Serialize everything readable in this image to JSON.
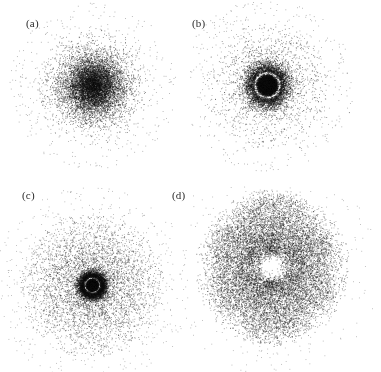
{
  "figure": {
    "width": 381,
    "height": 372,
    "background": "#ffffff",
    "point_color": "#101010",
    "type": "multi-panel-scatter-density"
  },
  "panels": [
    {
      "id": "a",
      "label": "(a)",
      "label_x": 26,
      "label_y": 18,
      "center_x": 93,
      "center_y": 86,
      "n_points": 9000,
      "seed": 1317,
      "point_size": 0.85,
      "opacity": 0.55,
      "model": "radial",
      "description": "single dense central blob, smooth gaussian falloff, no nodes",
      "nodes": [],
      "outer_radius": 60,
      "core_sigma": 16,
      "angular": {
        "type": "isotropic",
        "lobes": 0
      }
    },
    {
      "id": "b",
      "label": "(b)",
      "label_x": 192,
      "label_y": 18,
      "center_x": 267,
      "center_y": 85,
      "n_points": 11000,
      "seed": 7741,
      "point_size": 0.85,
      "opacity": 0.55,
      "model": "radial",
      "description": "solid dark core, white annular node gap, broad diffuse outer cloud",
      "nodes": [
        12
      ],
      "outer_radius": 62,
      "core_sigma": 7,
      "angular": {
        "type": "isotropic",
        "lobes": 0
      }
    },
    {
      "id": "c",
      "label": "(c)",
      "label_x": 22,
      "label_y": 190,
      "center_x": 92,
      "center_y": 285,
      "n_points": 13000,
      "seed": 4409,
      "point_size": 0.85,
      "opacity": 0.5,
      "model": "radial",
      "description": "tiny dark center dot, inner white node, dark annulus, second white node, wide diffuse halo",
      "nodes": [
        7,
        24
      ],
      "outer_radius": 72,
      "core_sigma": 4,
      "angular": {
        "type": "isotropic",
        "lobes": 0
      }
    },
    {
      "id": "d",
      "label": "(d)",
      "label_x": 172,
      "label_y": 190,
      "center_x": 272,
      "center_y": 267,
      "n_points": 13000,
      "seed": 2213,
      "point_size": 0.85,
      "opacity": 0.5,
      "model": "angular",
      "description": "six-lobed flower pattern with empty centre; vertical top and bottom lobes densest",
      "nodes": [],
      "outer_radius": 78,
      "core_sigma": 30,
      "angular": {
        "type": "lobed",
        "lobes": 6,
        "lobe_angles_deg": [
          90,
          30,
          330,
          270,
          210,
          150
        ],
        "lobe_weights": [
          1.0,
          0.52,
          0.52,
          1.0,
          0.52,
          0.52
        ],
        "lobe_width_deg": 26,
        "hollow_radius": 14
      }
    }
  ]
}
